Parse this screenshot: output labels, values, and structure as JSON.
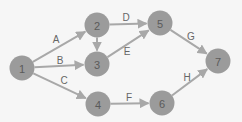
{
  "diagram": {
    "type": "network-activity-on-arrow",
    "colors": {
      "background": "#f6f6f6",
      "node": "#9b9b9b",
      "edge": "#a8a8a8",
      "text": "#5a5a5a"
    },
    "nodes": [
      {
        "id": "1",
        "label": "1",
        "x": 22,
        "y": 68
      },
      {
        "id": "2",
        "label": "2",
        "x": 97,
        "y": 25
      },
      {
        "id": "3",
        "label": "3",
        "x": 97,
        "y": 64
      },
      {
        "id": "4",
        "label": "4",
        "x": 98,
        "y": 104
      },
      {
        "id": "5",
        "label": "5",
        "x": 160,
        "y": 23
      },
      {
        "id": "6",
        "label": "6",
        "x": 162,
        "y": 103
      },
      {
        "id": "7",
        "label": "7",
        "x": 218,
        "y": 61
      }
    ],
    "edges": [
      {
        "from": "1",
        "to": "2",
        "label": "A",
        "lx": 56,
        "ly": 39
      },
      {
        "from": "1",
        "to": "3",
        "label": "B",
        "lx": 60,
        "ly": 60
      },
      {
        "from": "1",
        "to": "4",
        "label": "C",
        "lx": 64,
        "ly": 80
      },
      {
        "from": "2",
        "to": "3",
        "label": "",
        "lx": 0,
        "ly": 0
      },
      {
        "from": "2",
        "to": "5",
        "label": "D",
        "lx": 126,
        "ly": 17
      },
      {
        "from": "3",
        "to": "5",
        "label": "E",
        "lx": 127,
        "ly": 51
      },
      {
        "from": "4",
        "to": "6",
        "label": "F",
        "lx": 129,
        "ly": 97
      },
      {
        "from": "5",
        "to": "7",
        "label": "G",
        "lx": 191,
        "ly": 36
      },
      {
        "from": "6",
        "to": "7",
        "label": "H",
        "lx": 187,
        "ly": 77
      }
    ]
  }
}
